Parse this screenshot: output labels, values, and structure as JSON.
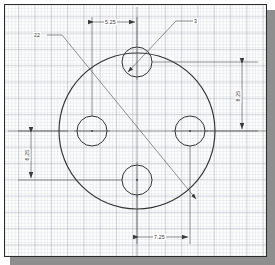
{
  "sheet": {
    "background_color": "#fdfdfd",
    "border_color": "#2b2b2b",
    "shadow_color": "#8e8e8e",
    "grid_color": "#96a0af"
  },
  "drawing": {
    "title": "circular-plate-with-four-bolt-holes",
    "line_color": "#333333",
    "dimension_color": "#3a3a3a"
  },
  "geometry": {
    "plate": {
      "center_x": 137,
      "center_y": 131,
      "radius": 78
    },
    "holes": [
      {
        "name": "top-hole",
        "cx": 137,
        "cy": 62,
        "r": 15
      },
      {
        "name": "left-hole",
        "cx": 92,
        "cy": 131,
        "r": 15
      },
      {
        "name": "right-hole",
        "cx": 190,
        "cy": 131,
        "r": 15
      },
      {
        "name": "bottom-hole",
        "cx": 137,
        "cy": 180,
        "r": 15
      }
    ]
  },
  "dimensions": {
    "top_horizontal": {
      "label": "5.25",
      "name": "dimension-5-25"
    },
    "right_vertical": {
      "label": "8.25",
      "name": "dimension-8-25"
    },
    "left_vertical": {
      "label": "6.25",
      "name": "dimension-6-25"
    },
    "bottom_horizontal": {
      "label": "7.25",
      "name": "dimension-7-25"
    }
  },
  "leaders": {
    "plate_diameter": {
      "label": "22",
      "name": "leader-plate-diameter"
    },
    "hole_diameter": {
      "label": "3",
      "name": "leader-hole-diameter"
    }
  }
}
